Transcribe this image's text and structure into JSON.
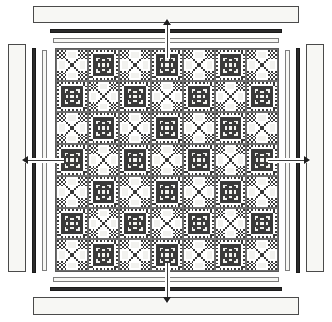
{
  "quilt": {
    "rows": 7,
    "columns": 7,
    "block_types": [
      "A",
      "B"
    ],
    "layout": [
      [
        "A",
        "B",
        "A",
        "B",
        "A",
        "B",
        "A"
      ],
      [
        "B",
        "A",
        "B",
        "A",
        "B",
        "A",
        "B"
      ],
      [
        "A",
        "B",
        "A",
        "B",
        "A",
        "B",
        "A"
      ],
      [
        "B",
        "A",
        "B",
        "A",
        "B",
        "A",
        "B"
      ],
      [
        "A",
        "B",
        "A",
        "B",
        "A",
        "B",
        "A"
      ],
      [
        "B",
        "A",
        "B",
        "A",
        "B",
        "A",
        "B"
      ],
      [
        "A",
        "B",
        "A",
        "B",
        "A",
        "B",
        "A"
      ]
    ],
    "block_a_name": "nine-patch-snowball-block",
    "block_b_name": "star-patch-block",
    "colors": {
      "dark": "#3a3a3a",
      "medium": "#9a9a9a",
      "light": "#f2f2ef",
      "outline": "#5a5a5a"
    }
  },
  "borders": {
    "top": [
      {
        "name": "outer-border-strip-top",
        "style": "wide-light"
      },
      {
        "name": "accent-border-strip-top",
        "style": "thin-dark"
      },
      {
        "name": "inner-border-strip-top",
        "style": "thin-light"
      }
    ],
    "bottom": [
      {
        "name": "inner-border-strip-bottom",
        "style": "thin-light"
      },
      {
        "name": "accent-border-strip-bottom",
        "style": "thin-dark"
      },
      {
        "name": "outer-border-strip-bottom",
        "style": "wide-light"
      }
    ],
    "left": [
      {
        "name": "outer-border-strip-left",
        "style": "wide-light"
      },
      {
        "name": "accent-border-strip-left",
        "style": "thin-dark"
      },
      {
        "name": "inner-border-strip-left",
        "style": "thin-light"
      }
    ],
    "right": [
      {
        "name": "inner-border-strip-right",
        "style": "thin-light"
      },
      {
        "name": "accent-border-strip-right",
        "style": "thin-dark"
      },
      {
        "name": "outer-border-strip-right",
        "style": "wide-light"
      }
    ],
    "colors": {
      "light_fill": "#f7f7f4",
      "light_edge": "#4a4a4a",
      "dark_fill": "#2b2b2b"
    }
  },
  "arrows": {
    "top": {
      "name": "assembly-arrow-top",
      "direction": "up"
    },
    "bottom": {
      "name": "assembly-arrow-bottom",
      "direction": "down"
    },
    "left": {
      "name": "assembly-arrow-left",
      "direction": "left"
    },
    "right": {
      "name": "assembly-arrow-right",
      "direction": "right"
    }
  }
}
